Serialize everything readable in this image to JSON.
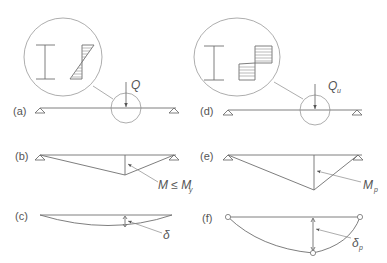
{
  "figure": {
    "panels": [
      {
        "id": "a",
        "label": "(a)",
        "load_label": "Q",
        "load_sub": ""
      },
      {
        "id": "b",
        "label": "(b)",
        "moment_label": "M ≤ M",
        "moment_sub": "y"
      },
      {
        "id": "c",
        "label": "(c)",
        "deflection_label": "δ",
        "deflection_sub": ""
      },
      {
        "id": "d",
        "label": "(d)",
        "load_label": "Q",
        "load_sub": "u"
      },
      {
        "id": "e",
        "label": "(e)",
        "moment_label": "M",
        "moment_sub": "p"
      },
      {
        "id": "f",
        "label": "(f)",
        "deflection_label": "δ",
        "deflection_sub": "p"
      }
    ],
    "insets": [
      {
        "id": "elastic-stress",
        "description": "I-section with linear (elastic) stress distribution"
      },
      {
        "id": "plastic-stress",
        "description": "I-section with rectangular (fully plastic) stress distribution"
      }
    ],
    "colors": {
      "line": "#6f6f6f",
      "text": "#555555",
      "background": "#ffffff"
    }
  }
}
